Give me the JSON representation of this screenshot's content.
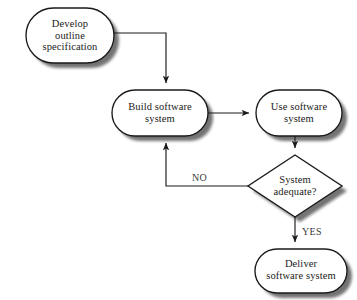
{
  "diagram": {
    "background_color": "#ffffff",
    "stroke_color": "#1a1a1a",
    "shadow_color": "#cfcbc6",
    "text_color": "#1a1a1a",
    "nodes": [
      {
        "id": "develop-outline-specification",
        "shape": "stadium",
        "label": "Develop\noutline\nspecification",
        "x": 26,
        "y": 8,
        "width": 88,
        "height": 55
      },
      {
        "id": "build-software-system",
        "shape": "stadium",
        "label": "Build software\nsystem",
        "x": 112,
        "y": 90,
        "width": 96,
        "height": 46
      },
      {
        "id": "use-software-system",
        "shape": "stadium",
        "label": "Use software\nsystem",
        "x": 256,
        "y": 90,
        "width": 86,
        "height": 46
      },
      {
        "id": "system-adequate",
        "shape": "diamond",
        "label": "System\nadequate?",
        "x": 248,
        "y": 155,
        "width": 94,
        "height": 62
      },
      {
        "id": "deliver-software-system",
        "shape": "stadium",
        "label": "Deliver\nsoftware system",
        "x": 255,
        "y": 249,
        "width": 92,
        "height": 44
      }
    ],
    "edges": [
      {
        "id": "spec-to-build",
        "from": "develop-outline-specification",
        "to": "build-software-system",
        "label": ""
      },
      {
        "id": "build-to-use",
        "from": "build-software-system",
        "to": "use-software-system",
        "label": ""
      },
      {
        "id": "use-to-decision",
        "from": "use-software-system",
        "to": "system-adequate",
        "label": ""
      },
      {
        "id": "decision-to-build-no",
        "from": "system-adequate",
        "to": "build-software-system",
        "label": "NO"
      },
      {
        "id": "decision-to-deliver-yes",
        "from": "system-adequate",
        "to": "deliver-software-system",
        "label": "YES"
      }
    ],
    "labels": {
      "no": "NO",
      "yes": "YES"
    }
  }
}
